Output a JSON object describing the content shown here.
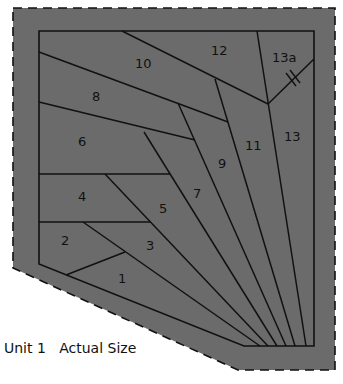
{
  "diagram": {
    "caption": "Unit 1   Actual Size",
    "colors": {
      "fill": "#6b6b6b",
      "line": "#111111",
      "background": "#ffffff"
    },
    "pieces": [
      {
        "id": "1",
        "label": "1"
      },
      {
        "id": "2",
        "label": "2"
      },
      {
        "id": "3",
        "label": "3"
      },
      {
        "id": "4",
        "label": "4"
      },
      {
        "id": "5",
        "label": "5"
      },
      {
        "id": "6",
        "label": "6"
      },
      {
        "id": "7",
        "label": "7"
      },
      {
        "id": "8",
        "label": "8"
      },
      {
        "id": "9",
        "label": "9"
      },
      {
        "id": "10",
        "label": "10"
      },
      {
        "id": "11",
        "label": "11"
      },
      {
        "id": "12",
        "label": "12"
      },
      {
        "id": "13",
        "label": "13"
      },
      {
        "id": "13a",
        "label": "13a"
      }
    ],
    "markers": {
      "seam_mark": "double-hash on 13/13a seam"
    }
  }
}
